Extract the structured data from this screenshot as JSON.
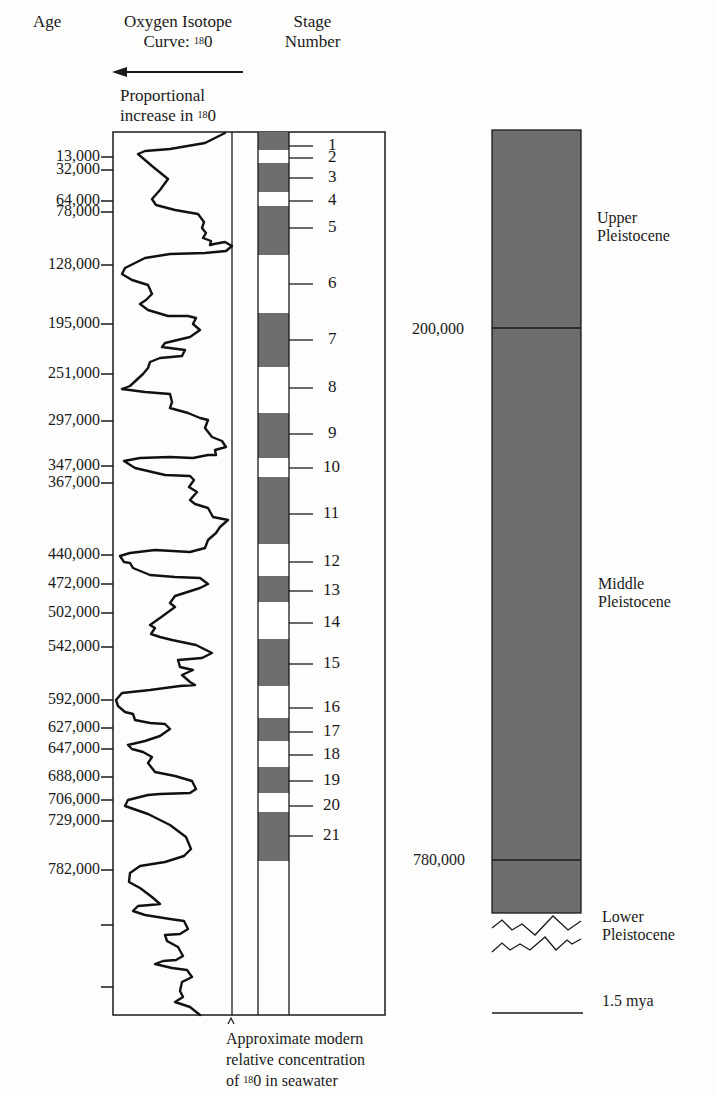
{
  "headers": {
    "age": "Age",
    "curve_line1": "Oxygen Isotope",
    "curve_line2_prefix": "Curve: ",
    "curve_sup": "18",
    "curve_line2_suffix": "0",
    "stage_line1": "Stage",
    "stage_line2": "Number",
    "arrow_caption_line1": "Proportional",
    "arrow_caption_line2_prefix": "increase in ",
    "arrow_caption_sup": "18",
    "arrow_caption_line2_suffix": "0"
  },
  "footnote": {
    "line1": "Approximate modern",
    "line2": "relative concentration",
    "line3_prefix": "of ",
    "line3_sup": "18",
    "line3_suffix": "0 in seawater"
  },
  "colors": {
    "band_dark": "#6e6e6e",
    "band_light": "#ffffff",
    "ink": "#1a1a1a",
    "background": "#fdfdfc"
  },
  "age_ticks": [
    {
      "label": "13,000",
      "y": 157
    },
    {
      "label": "32,000",
      "y": 170
    },
    {
      "label": "64,000",
      "y": 201
    },
    {
      "label": "78,000",
      "y": 212
    },
    {
      "label": "128,000",
      "y": 265
    },
    {
      "label": "195,000",
      "y": 324
    },
    {
      "label": "251,000",
      "y": 374
    },
    {
      "label": "297,000",
      "y": 421
    },
    {
      "label": "347,000",
      "y": 466
    },
    {
      "label": "367,000",
      "y": 483
    },
    {
      "label": "440,000",
      "y": 555
    },
    {
      "label": "472,000",
      "y": 584
    },
    {
      "label": "502,000",
      "y": 613
    },
    {
      "label": "542,000",
      "y": 647
    },
    {
      "label": "592,000",
      "y": 700
    },
    {
      "label": "627,000",
      "y": 728
    },
    {
      "label": "647,000",
      "y": 749
    },
    {
      "label": "688,000",
      "y": 777
    },
    {
      "label": "706,000",
      "y": 800
    },
    {
      "label": "729,000",
      "y": 821
    },
    {
      "label": "782,000",
      "y": 870
    },
    {
      "label": "",
      "y": 925
    },
    {
      "label": "",
      "y": 987
    }
  ],
  "stages": [
    {
      "number": "1",
      "top": 132,
      "bottom": 150,
      "type": "dark",
      "tick_y": 146
    },
    {
      "number": "2",
      "top": 150,
      "bottom": 163,
      "type": "light",
      "tick_y": 158
    },
    {
      "number": "3",
      "top": 163,
      "bottom": 192,
      "type": "dark",
      "tick_y": 178
    },
    {
      "number": "4",
      "top": 192,
      "bottom": 206,
      "type": "light",
      "tick_y": 201
    },
    {
      "number": "5",
      "top": 206,
      "bottom": 255,
      "type": "dark",
      "tick_y": 228
    },
    {
      "number": "6",
      "top": 255,
      "bottom": 313,
      "type": "light",
      "tick_y": 284
    },
    {
      "number": "7",
      "top": 313,
      "bottom": 367,
      "type": "dark",
      "tick_y": 340
    },
    {
      "number": "8",
      "top": 367,
      "bottom": 413,
      "type": "light",
      "tick_y": 388
    },
    {
      "number": "9",
      "top": 413,
      "bottom": 458,
      "type": "dark",
      "tick_y": 434
    },
    {
      "number": "10",
      "top": 458,
      "bottom": 477,
      "type": "light",
      "tick_y": 468
    },
    {
      "number": "11",
      "top": 477,
      "bottom": 544,
      "type": "dark",
      "tick_y": 514
    },
    {
      "number": "12",
      "top": 544,
      "bottom": 576,
      "type": "light",
      "tick_y": 562
    },
    {
      "number": "13",
      "top": 576,
      "bottom": 602,
      "type": "dark",
      "tick_y": 591
    },
    {
      "number": "14",
      "top": 602,
      "bottom": 639,
      "type": "light",
      "tick_y": 623
    },
    {
      "number": "15",
      "top": 639,
      "bottom": 686,
      "type": "dark",
      "tick_y": 664
    },
    {
      "number": "16",
      "top": 686,
      "bottom": 718,
      "type": "light",
      "tick_y": 708
    },
    {
      "number": "17",
      "top": 718,
      "bottom": 741,
      "type": "dark",
      "tick_y": 732
    },
    {
      "number": "18",
      "top": 741,
      "bottom": 767,
      "type": "light",
      "tick_y": 755
    },
    {
      "number": "19",
      "top": 767,
      "bottom": 793,
      "type": "dark",
      "tick_y": 781
    },
    {
      "number": "20",
      "top": 793,
      "bottom": 812,
      "type": "light",
      "tick_y": 806
    },
    {
      "number": "21",
      "top": 812,
      "bottom": 861,
      "type": "dark",
      "tick_y": 836
    }
  ],
  "curve_points": "225,133 205,143 170,149 145,151 138,154 152,166 168,179 160,190 152,199 156,205 175,210 198,214 204,222 202,228 206,233 203,238 211,241 210,245 214,244 225,242 232,246 226,251 205,253 170,254 145,258 125,268 122,274 132,280 148,285 152,294 146,300 140,304 148,310 168,316 188,316 196,318 193,324 200,330 190,337 165,343 162,347 185,350 182,356 160,358 150,362 148,368 143,374 130,386 122,389 145,392 170,394 172,402 170,408 188,413 200,418 208,420 205,428 212,437 222,441 226,447 215,450 216,455 208,455 193,458 170,457 140,458 124,461 135,468 165,475 190,476 194,480 189,487 197,492 190,500 195,504 208,508 213,517 228,520 220,527 216,533 208,540 205,548 190,552 155,550 130,553 120,556 124,562 130,563 133,568 150,575 175,577 200,578 208,584 200,588 175,596 170,603 175,607 160,618 150,625 155,628 151,634 160,637 172,640 196,645 212,653 202,658 178,660 180,667 193,670 182,675 190,682 195,685 180,686 150,690 122,693 116,700 118,706 125,712 133,714 135,720 150,723 165,724 170,729 160,736 145,741 128,745 132,749 143,752 152,757 148,763 155,772 175,776 192,781 196,789 190,793 160,794 148,795 128,800 125,806 148,814 170,825 186,837 191,849 184,856 165,862 140,866 130,873 129,882 140,888 152,897 160,904 150,905 138,906 133,911 145,915 170,919 184,921 188,929 180,934 165,935 167,941 178,947 183,956 176,960 163,961 155,964 172,968 187,970 192,977 182,982 180,991 183,997 175,1002 190,1007 200,1015",
  "right_column": {
    "labels": {
      "upper_line1": "Upper",
      "upper_line2": "Pleistocene",
      "middle_line1": "Middle",
      "middle_line2": "Pleistocene",
      "lower_line1": "Lower",
      "lower_line2": "Pleistocene",
      "boundary_200k": "200,000",
      "boundary_780k": "780,000",
      "bottom_age": "1.5 mya"
    }
  },
  "chart_data": {
    "type": "line",
    "xlabel": "Proportional increase in 18O (leftward)",
    "ylabel": "Age",
    "age_tick_labels": [
      "13,000",
      "32,000",
      "64,000",
      "78,000",
      "128,000",
      "195,000",
      "251,000",
      "297,000",
      "347,000",
      "367,000",
      "440,000",
      "472,000",
      "502,000",
      "542,000",
      "592,000",
      "627,000",
      "647,000",
      "688,000",
      "706,000",
      "729,000",
      "782,000"
    ],
    "stage_numbers": [
      "1",
      "2",
      "3",
      "4",
      "5",
      "6",
      "7",
      "8",
      "9",
      "10",
      "11",
      "12",
      "13",
      "14",
      "15",
      "16",
      "17",
      "18",
      "19",
      "20",
      "21"
    ],
    "stage_type": [
      "warm",
      "cold",
      "warm",
      "cold",
      "warm",
      "cold",
      "warm",
      "cold",
      "warm",
      "cold",
      "warm",
      "cold",
      "warm",
      "cold",
      "warm",
      "cold",
      "warm",
      "cold",
      "warm",
      "cold",
      "warm"
    ],
    "epochs": [
      {
        "name": "Upper Pleistocene",
        "from": 0,
        "to": 200000
      },
      {
        "name": "Middle Pleistocene",
        "from": 200000,
        "to": 780000
      },
      {
        "name": "Lower Pleistocene",
        "from": 780000,
        "to": 1500000
      }
    ],
    "annotations": [
      "Approximate modern relative concentration of 18O in seawater"
    ],
    "grid": false
  }
}
